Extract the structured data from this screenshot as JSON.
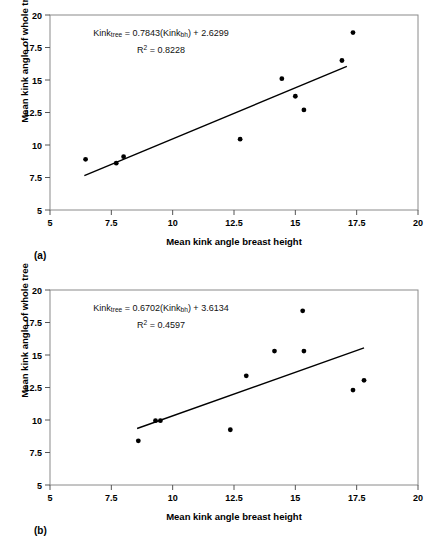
{
  "figure": {
    "panels": [
      {
        "tag": "(a)",
        "equation_line1_prefix": "Kink",
        "equation_line1_sub1": "tree",
        "equation_line1_mid": " = 0.7843(Kink",
        "equation_line1_sub2": "bh",
        "equation_line1_suffix": ") + 2.6299",
        "equation_line2_prefix": "R",
        "equation_line2_sup": "2",
        "equation_line2_suffix": " = 0.8228"
      },
      {
        "tag": "(b)",
        "equation_line1_prefix": "Kink",
        "equation_line1_sub1": "tree",
        "equation_line1_mid": " = 0.6702(Kink",
        "equation_line1_sub2": "bh",
        "equation_line1_suffix": ") + 3.6134",
        "equation_line2_prefix": "R",
        "equation_line2_sup": "2",
        "equation_line2_suffix": " = 0.4597"
      }
    ]
  },
  "chart_data": [
    {
      "type": "scatter",
      "panel": "(a)",
      "title": "",
      "xlabel": "Mean kink angle breast height",
      "ylabel": "Mean kink angle of whole tree",
      "xlim": [
        5,
        20
      ],
      "ylim": [
        5,
        20
      ],
      "xticks": [
        5,
        7.5,
        10,
        12.5,
        15,
        17.5,
        20
      ],
      "yticks": [
        5,
        7.5,
        10,
        12.5,
        15,
        17.5,
        20
      ],
      "xticklabels": [
        "5",
        "7.5",
        "10",
        "12.5",
        "15",
        "17.5",
        "20"
      ],
      "yticklabels": [
        "5",
        "7.5",
        "10",
        "12.5",
        "15",
        "17.5",
        "20"
      ],
      "grid": false,
      "legend": false,
      "marker_color": "#000000",
      "line_color": "#000000",
      "points": [
        {
          "x": 6.45,
          "y": 8.9
        },
        {
          "x": 7.7,
          "y": 8.6
        },
        {
          "x": 8.0,
          "y": 9.1
        },
        {
          "x": 12.75,
          "y": 10.45
        },
        {
          "x": 14.45,
          "y": 15.1
        },
        {
          "x": 15.0,
          "y": 13.75
        },
        {
          "x": 15.35,
          "y": 12.7
        },
        {
          "x": 16.9,
          "y": 16.5
        },
        {
          "x": 17.35,
          "y": 18.65
        }
      ],
      "fit": {
        "slope": 0.7843,
        "intercept": 2.6299,
        "r_squared": 0.8228,
        "equation": "Kink_tree = 0.7843(Kink_bh) + 2.6299",
        "r2_text": "R2 = 0.8228",
        "x_start": 6.4,
        "x_end": 17.1
      }
    },
    {
      "type": "scatter",
      "panel": "(b)",
      "title": "",
      "xlabel": "Mean kink angle breast height",
      "ylabel": "Mean kink angle of whole tree",
      "xlim": [
        5,
        20
      ],
      "ylim": [
        5,
        20
      ],
      "xticks": [
        5,
        7.5,
        10,
        12.5,
        15,
        17.5,
        20
      ],
      "yticks": [
        5,
        7.5,
        10,
        12.5,
        15,
        17.5,
        20
      ],
      "xticklabels": [
        "5",
        "7.5",
        "10",
        "12.5",
        "15",
        "17.5",
        "20"
      ],
      "yticklabels": [
        "5",
        "7.5",
        "10",
        "12.5",
        "15",
        "17.5",
        "20"
      ],
      "grid": false,
      "legend": false,
      "marker_color": "#000000",
      "line_color": "#000000",
      "points": [
        {
          "x": 8.6,
          "y": 8.4
        },
        {
          "x": 9.3,
          "y": 9.95
        },
        {
          "x": 9.5,
          "y": 9.95
        },
        {
          "x": 12.35,
          "y": 9.25
        },
        {
          "x": 13.0,
          "y": 13.4
        },
        {
          "x": 14.15,
          "y": 15.3
        },
        {
          "x": 15.3,
          "y": 18.4
        },
        {
          "x": 15.35,
          "y": 15.3
        },
        {
          "x": 17.35,
          "y": 12.3
        },
        {
          "x": 17.8,
          "y": 13.05
        }
      ],
      "fit": {
        "slope": 0.6702,
        "intercept": 3.6134,
        "r_squared": 0.4597,
        "equation": "Kink_tree = 0.6702(Kink_bh) + 3.6134",
        "r2_text": "R2 = 0.4597",
        "x_start": 8.55,
        "x_end": 17.8
      }
    }
  ]
}
